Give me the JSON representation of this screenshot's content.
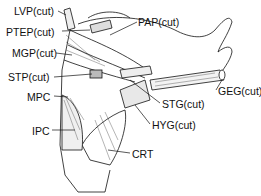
{
  "figure": {
    "type": "anatomical line drawing of pharyngeal constrictor muscles (lateral view)",
    "labels": [
      {
        "id": "lvp",
        "text": "LVP(cut)",
        "x": 14,
        "y": 6
      },
      {
        "id": "ptep",
        "text": "PTEP(cut)",
        "x": 6,
        "y": 27
      },
      {
        "id": "mgp",
        "text": "MGP(cut)",
        "x": 12,
        "y": 48
      },
      {
        "id": "stp",
        "text": "STP(cut)",
        "x": 8,
        "y": 72
      },
      {
        "id": "mpc",
        "text": "MPC",
        "x": 27,
        "y": 92
      },
      {
        "id": "ipc",
        "text": "IPC",
        "x": 32,
        "y": 126
      },
      {
        "id": "pap",
        "text": "PAP(cut)",
        "x": 138,
        "y": 17
      },
      {
        "id": "geg",
        "text": "GEG(cut)",
        "x": 218,
        "y": 86
      },
      {
        "id": "stg",
        "text": "STG(cut)",
        "x": 162,
        "y": 99
      },
      {
        "id": "hyg",
        "text": "HYG(cut)",
        "x": 152,
        "y": 120
      },
      {
        "id": "crt",
        "text": "CRT",
        "x": 132,
        "y": 149
      }
    ]
  }
}
